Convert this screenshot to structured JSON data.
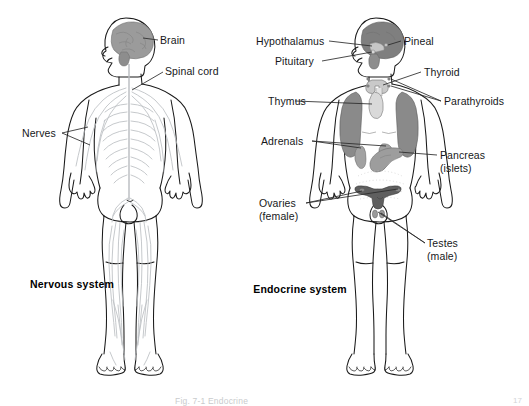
{
  "figure": {
    "title_left": "Nervous system",
    "title_right": "Endocrine system",
    "footer_caption": "Fig. 7-1  Endocrine",
    "page_number": "17",
    "colors": {
      "outline": "#1a1a1a",
      "organ_dark": "#8a8a8a",
      "organ_mid": "#9a9a9a",
      "organ_light": "#a8a8a8",
      "nerve": "#b9bcc0",
      "leader": "#2a2a2a",
      "background": "#ffffff"
    }
  },
  "nervous_system": {
    "labels": [
      {
        "name": "brain",
        "text": "Brain"
      },
      {
        "name": "spinal-cord",
        "text": "Spinal cord"
      },
      {
        "name": "nerves",
        "text": "Nerves"
      }
    ]
  },
  "endocrine_system": {
    "labels": [
      {
        "name": "hypothalamus",
        "text": "Hypothalamus"
      },
      {
        "name": "pineal",
        "text": "Pineal"
      },
      {
        "name": "pituitary",
        "text": "Pituitary"
      },
      {
        "name": "thyroid",
        "text": "Thyroid"
      },
      {
        "name": "thymus",
        "text": "Thymus"
      },
      {
        "name": "parathyroids",
        "text": "Parathyroids"
      },
      {
        "name": "adrenals",
        "text": "Adrenals"
      },
      {
        "name": "pancreas",
        "text": "Pancreas",
        "text2": "(islets)"
      },
      {
        "name": "ovaries",
        "text": "Ovaries",
        "text2": "(female)"
      },
      {
        "name": "testes",
        "text": "Testes",
        "text2": "(male)"
      }
    ]
  }
}
